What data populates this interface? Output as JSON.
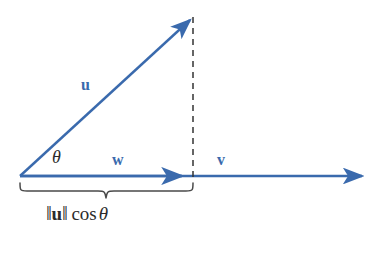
{
  "diagram": {
    "background_color": "#ffffff",
    "vector_color": "#3a6aad",
    "annotation_color": "#2b2b2b",
    "labels": {
      "u": "u",
      "v": "v",
      "w": "w",
      "theta": "θ",
      "norm_bar": "‖",
      "u_bold": "u",
      "cos": "cos",
      "theta_formula": "θ"
    },
    "geometry": {
      "origin": {
        "x": 20,
        "y": 176
      },
      "u_tip": {
        "x": 196,
        "y": 14
      },
      "w_tip": {
        "x": 190,
        "y": 176
      },
      "v_tip": {
        "x": 370,
        "y": 176
      },
      "dashed_line_x": 193,
      "brace_left_x": 20,
      "brace_right_x": 193,
      "brace_y": 184
    }
  }
}
